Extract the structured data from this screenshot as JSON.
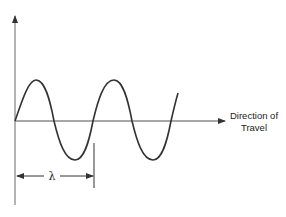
{
  "diagram": {
    "type": "transverse-wave",
    "direction_label_line1": "Direction of",
    "direction_label_line2": "Travel",
    "wavelength_symbol": "λ",
    "colors": {
      "axis": "#8a8a8a",
      "wave": "#333333",
      "text": "#222222",
      "marker": "#555555"
    }
  }
}
